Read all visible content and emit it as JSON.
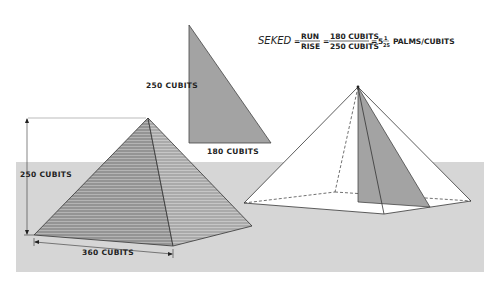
{
  "formula": {
    "term": "SEKED",
    "eq1": "=",
    "frac1_num": "RUN",
    "frac1_den": "RISE",
    "eq2": "=",
    "frac2_num": "180 CUBITS",
    "frac2_den": "250 CUBITS",
    "eq3": "=",
    "whole": "5",
    "frac3_num": "1",
    "frac3_den": "25",
    "unit": "PALMS/CUBITS"
  },
  "triangle": {
    "height_label": "250  CUBITS",
    "base_label": "180  CUBITS"
  },
  "left_pyramid": {
    "height_label": "250  CUBITS",
    "base_label": "360  CUBITS"
  },
  "colors": {
    "ground": "#d6d6d6",
    "face_dark": "#8f8f8f",
    "face_light": "#a8a8a8",
    "triangle_fill": "#a3a3a3",
    "line": "#333333"
  }
}
